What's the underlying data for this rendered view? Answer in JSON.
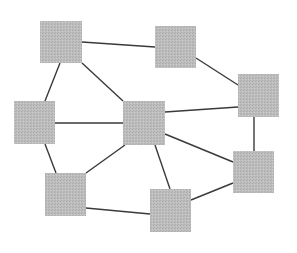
{
  "diagram": {
    "type": "network-graph",
    "node_color": "#b9b9b9",
    "edge_color": "#3a3a3a",
    "nodes": [
      {
        "id": "A",
        "x": 40,
        "y": 21,
        "w": 42,
        "h": 42
      },
      {
        "id": "B",
        "x": 155,
        "y": 26,
        "w": 41,
        "h": 42
      },
      {
        "id": "C",
        "x": 238,
        "y": 74,
        "w": 41,
        "h": 43
      },
      {
        "id": "D",
        "x": 14,
        "y": 101,
        "w": 41,
        "h": 43
      },
      {
        "id": "E",
        "x": 123,
        "y": 101,
        "w": 42,
        "h": 44
      },
      {
        "id": "F",
        "x": 233,
        "y": 151,
        "w": 41,
        "h": 42
      },
      {
        "id": "G",
        "x": 45,
        "y": 173,
        "w": 41,
        "h": 43
      },
      {
        "id": "H",
        "x": 150,
        "y": 189,
        "w": 41,
        "h": 43
      }
    ],
    "edges": [
      {
        "from": "A",
        "to": "B",
        "x1": 82,
        "y1": 42,
        "x2": 155,
        "y2": 47
      },
      {
        "from": "A",
        "to": "D",
        "x1": 60,
        "y1": 63,
        "x2": 45,
        "y2": 101
      },
      {
        "from": "A",
        "to": "E",
        "x1": 82,
        "y1": 63,
        "x2": 123,
        "y2": 101
      },
      {
        "from": "B",
        "to": "C",
        "x1": 196,
        "y1": 58,
        "x2": 238,
        "y2": 85
      },
      {
        "from": "E",
        "to": "C",
        "x1": 165,
        "y1": 112,
        "x2": 238,
        "y2": 107
      },
      {
        "from": "C",
        "to": "F",
        "x1": 254,
        "y1": 117,
        "x2": 254,
        "y2": 151
      },
      {
        "from": "D",
        "to": "E",
        "x1": 55,
        "y1": 123,
        "x2": 123,
        "y2": 123
      },
      {
        "from": "D",
        "to": "G",
        "x1": 45,
        "y1": 144,
        "x2": 56,
        "y2": 173
      },
      {
        "from": "E",
        "to": "G",
        "x1": 125,
        "y1": 145,
        "x2": 86,
        "y2": 173
      },
      {
        "from": "E",
        "to": "H",
        "x1": 155,
        "y1": 145,
        "x2": 170,
        "y2": 189
      },
      {
        "from": "E",
        "to": "F",
        "x1": 165,
        "y1": 134,
        "x2": 233,
        "y2": 162
      },
      {
        "from": "H",
        "to": "F",
        "x1": 191,
        "y1": 200,
        "x2": 233,
        "y2": 183
      },
      {
        "from": "G",
        "to": "H",
        "x1": 86,
        "y1": 208,
        "x2": 150,
        "y2": 214
      }
    ]
  }
}
